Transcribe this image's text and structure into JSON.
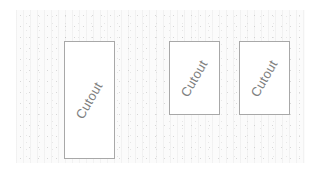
{
  "canvas": {
    "background": "#ffffff",
    "texture_color": "#fbfbfb"
  },
  "cutouts": [
    {
      "label": "Cutout",
      "x": 64,
      "y": 41,
      "width": 51,
      "height": 118
    },
    {
      "label": "Cutout",
      "x": 169,
      "y": 41,
      "width": 51,
      "height": 74
    },
    {
      "label": "Cutout",
      "x": 239,
      "y": 41,
      "width": 51,
      "height": 74
    }
  ],
  "colors": {
    "border": "#a8a8a8",
    "text": "#808080"
  }
}
